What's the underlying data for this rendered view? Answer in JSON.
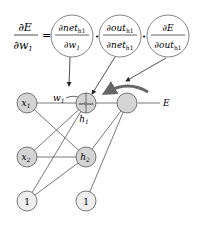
{
  "formula": {
    "lhs_num": "∂E",
    "lhs_den": "∂w",
    "lhs_den_sub": "1",
    "equals": "=",
    "dot": "•",
    "terms": [
      {
        "num": "∂net",
        "num_sub": "h1",
        "den": "∂w",
        "den_sub": "1"
      },
      {
        "num": "∂out",
        "num_sub": "h1",
        "den": "∂net",
        "den_sub": "h1"
      },
      {
        "num": "∂E",
        "num_sub": "",
        "den": "∂out",
        "den_sub": "h1"
      }
    ]
  },
  "network": {
    "nodes": {
      "x1": {
        "label": "x",
        "sub": "1"
      },
      "x2": {
        "label": "x",
        "sub": "2"
      },
      "h1": {
        "label": "net|out",
        "caption": "h",
        "caption_sub": "1"
      },
      "h2": {
        "label": "h",
        "sub": "2"
      },
      "o1": {
        "label": ""
      },
      "b1": {
        "label": "1"
      },
      "b2": {
        "label": "1"
      }
    },
    "weight_label": "w",
    "weight_sub": "1",
    "error_label": "E"
  },
  "colors": {
    "node_fill": "#d4d4d4",
    "stroke": "#555555",
    "backprop_arrow": "#666666"
  }
}
